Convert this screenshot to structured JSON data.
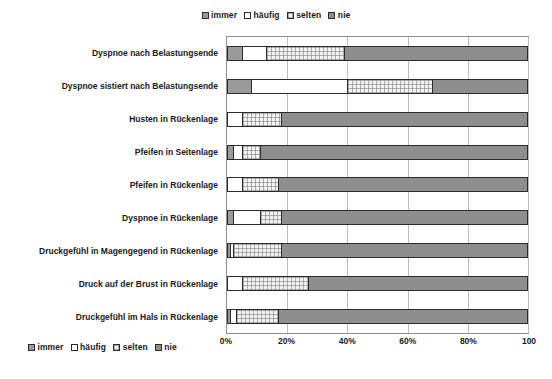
{
  "legend": {
    "items": [
      {
        "label": "immer",
        "pattern": "solid-gray",
        "color": "#9a9a9a"
      },
      {
        "label": "häufig",
        "pattern": "white",
        "color": "#ffffff"
      },
      {
        "label": "selten",
        "pattern": "light-hatch",
        "color": "#f2f2f2"
      },
      {
        "label": "nie",
        "pattern": "solid-gray",
        "color": "#8e8e8e"
      }
    ],
    "position_top": "top-center",
    "position_bottom": "bottom-left"
  },
  "chart_data": {
    "type": "bar",
    "orientation": "horizontal",
    "stacked": true,
    "normalized_percent": true,
    "title": "",
    "xlabel": "",
    "ylabel": "",
    "xlim": [
      0,
      100
    ],
    "xticks": [
      0,
      20,
      40,
      60,
      80,
      100
    ],
    "xtick_labels": [
      "0%",
      "20%",
      "40%",
      "60%",
      "80%",
      "100"
    ],
    "grid": true,
    "grid_axis": "x",
    "legend_entries": [
      "immer",
      "häufig",
      "selten",
      "nie"
    ],
    "categories": [
      "Dyspnoe nach Belastungsende",
      "Dyspnoe sistiert nach Belastungsende",
      "Husten in Rückenlage",
      "Pfeifen in Seitenlage",
      "Pfeifen in Rückenlage",
      "Dyspnoe in Rückenlage",
      "Druckgefühl in Magengegend in Rückenlage",
      "Druck auf der Brust in Rückenlage",
      "Druckgefühl im Hals in Rückenlage"
    ],
    "series": [
      {
        "name": "immer",
        "values": [
          5,
          8,
          0,
          2,
          0,
          2,
          1,
          0,
          1
        ]
      },
      {
        "name": "häufig",
        "values": [
          8,
          32,
          5,
          3,
          5,
          9,
          1,
          5,
          2
        ]
      },
      {
        "name": "selten",
        "values": [
          26,
          28,
          13,
          6,
          12,
          7,
          16,
          22,
          14
        ]
      },
      {
        "name": "nie",
        "values": [
          61,
          32,
          82,
          89,
          83,
          82,
          82,
          73,
          83
        ]
      }
    ]
  }
}
